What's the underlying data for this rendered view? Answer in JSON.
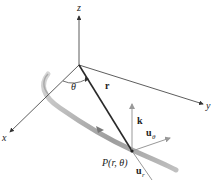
{
  "figure": {
    "axes": {
      "x_label": "x",
      "y_label": "y",
      "z_label": "z"
    },
    "angle_label": "θ",
    "position_vector_label": "r",
    "point_label": "P(r, θ)",
    "unit_vectors": {
      "k": "k",
      "u_theta_base": "u",
      "u_theta_sub": "θ",
      "u_r_base": "u",
      "u_r_sub": "r"
    },
    "colors": {
      "axis": "#333333",
      "vector": "#2a2a2a",
      "unit_vector": "#8a8a8a",
      "path": "#9a9a9a"
    }
  }
}
